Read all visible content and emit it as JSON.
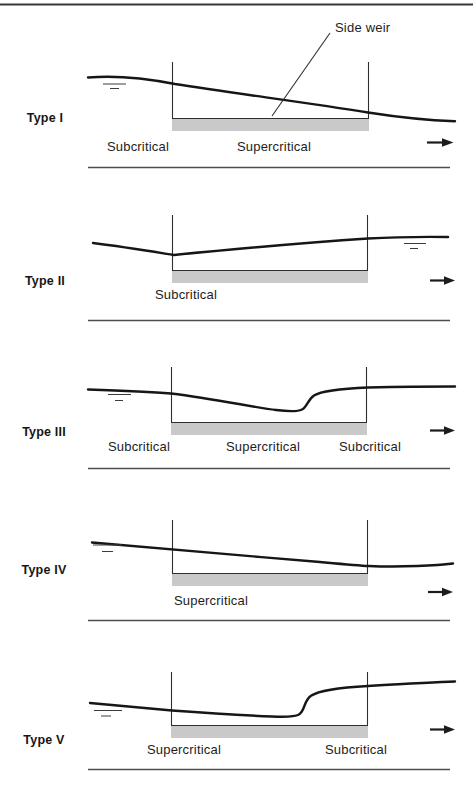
{
  "figure": {
    "annotation": {
      "side_weir": "Side weir"
    },
    "panels": [
      {
        "type_label": "Type I",
        "regime_left": "Subcritical",
        "regime_mid": "Supercritical"
      },
      {
        "type_label": "Type II",
        "regime_left": "Subcritical"
      },
      {
        "type_label": "Type III",
        "regime_left": "Subcritical",
        "regime_mid": "Supercritical",
        "regime_right": "Subcritical"
      },
      {
        "type_label": "Type IV",
        "regime_left": "Supercritical"
      },
      {
        "type_label": "Type V",
        "regime_left": "Supercritical",
        "regime_right": "Subcritical"
      }
    ],
    "icons": {
      "flow_arrow": "right-arrow",
      "water_level_marker": "free-surface-symbol"
    },
    "colors": {
      "ink": "#1c1c1c",
      "weir_fill": "#c9c9c9",
      "rule": "#4d4d4d"
    }
  }
}
